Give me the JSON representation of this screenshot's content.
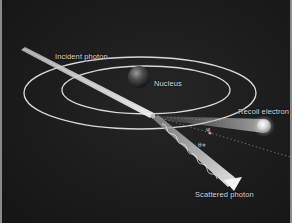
{
  "figure": {
    "labels": {
      "incident_photon": "Incident photon",
      "nucleus": "Nucleus",
      "recoil_electron": "Recoil electron",
      "scattered_photon": "Scattered photon"
    },
    "angles": {
      "electron_angle": "φ",
      "photon_angle": "θ"
    },
    "colors": {
      "background": "#1c1c1c",
      "orbit": "#d9d9d9",
      "beam": "#e6e6e6",
      "label": "#d8d8d8",
      "border": "#8a8a8a"
    }
  }
}
